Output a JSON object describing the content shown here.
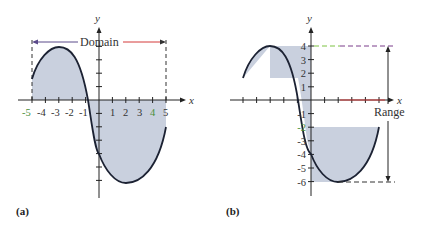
{
  "panels": [
    {
      "id": "a",
      "caption": "(a)",
      "x_axis_label": "x",
      "y_axis_label": "y",
      "annotation": "Domain",
      "x_tick_labels": [
        "-5",
        "-4",
        "-3",
        "-2",
        "-1",
        "1",
        "2",
        "3",
        "4",
        "5"
      ]
    },
    {
      "id": "b",
      "caption": "(b)",
      "x_axis_label": "x",
      "y_axis_label": "y",
      "annotation": "Range",
      "y_tick_labels": [
        "4",
        "3",
        "2",
        "1",
        "-1",
        "-2",
        "-3",
        "-4",
        "-5",
        "-6"
      ]
    }
  ],
  "curve": {
    "description": "smooth cubic-like curve on [-5,5]",
    "points": [
      [
        -5,
        1.6
      ],
      [
        -4,
        3.5
      ],
      [
        -3,
        4
      ],
      [
        -2,
        3.2
      ],
      [
        -1,
        1.0
      ],
      [
        -0.8,
        0
      ],
      [
        0,
        -4
      ],
      [
        1,
        -5.6
      ],
      [
        2,
        -6
      ],
      [
        3,
        -5.6
      ],
      [
        4,
        -4.3
      ],
      [
        5,
        -2
      ]
    ],
    "domain": "[-5, 5]",
    "range": "[-6, 4]"
  },
  "colors": {
    "fill": "#c9d0de",
    "curve": "#1c2233",
    "axis": "#222222",
    "domain_arrow_left": "#5b4a8a",
    "domain_arrow_right": "#d43a3a",
    "tick_label_green": "#4a8f3a",
    "range_dash_green": "#7cc242",
    "range_dash_purple": "#7a3d8a"
  }
}
